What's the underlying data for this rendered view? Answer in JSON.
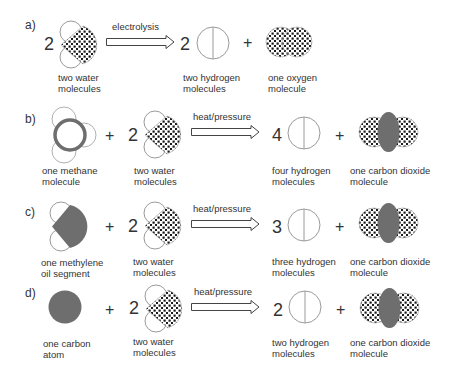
{
  "rows": [
    {
      "label": "a)",
      "reactants": [
        {
          "coef": "2",
          "molecule": "water",
          "caption": "two water\nmolecules"
        }
      ],
      "process": "electrolysis",
      "products": [
        {
          "coef": "2",
          "molecule": "hydrogen",
          "caption": "two hydrogen\nmolecules"
        },
        {
          "coef": "",
          "molecule": "oxygen",
          "caption": "one oxygen\nmolecule"
        }
      ]
    },
    {
      "label": "b)",
      "reactants": [
        {
          "coef": "",
          "molecule": "methane",
          "caption": "one methane\nmolecule"
        },
        {
          "coef": "2",
          "molecule": "water",
          "caption": "two water\nmolecules"
        }
      ],
      "process": "heat/pressure",
      "products": [
        {
          "coef": "4",
          "molecule": "hydrogen",
          "caption": "four hydrogen\nmolecules"
        },
        {
          "coef": "",
          "molecule": "carbon-dioxide",
          "caption": "one carbon dioxide\nmolecule"
        }
      ]
    },
    {
      "label": "c)",
      "reactants": [
        {
          "coef": "",
          "molecule": "methylene",
          "caption": "one methylene\noil segment"
        },
        {
          "coef": "2",
          "molecule": "water",
          "caption": "two water\nmolecules"
        }
      ],
      "process": "heat/pressure",
      "products": [
        {
          "coef": "3",
          "molecule": "hydrogen",
          "caption": "three hydrogen\nmolecules"
        },
        {
          "coef": "",
          "molecule": "carbon-dioxide",
          "caption": "one carbon dioxide\nmolecule"
        }
      ]
    },
    {
      "label": "d)",
      "reactants": [
        {
          "coef": "",
          "molecule": "carbon-atom",
          "caption": "one carbon\natom"
        },
        {
          "coef": "2",
          "molecule": "water",
          "caption": "two water\nmolecules"
        }
      ],
      "process": "heat/pressure",
      "products": [
        {
          "coef": "2",
          "molecule": "hydrogen",
          "caption": "two hydrogen\nmolecules"
        },
        {
          "coef": "",
          "molecule": "carbon-dioxide",
          "caption": "one carbon dioxide\nmolecule"
        }
      ]
    }
  ],
  "symbols": {
    "plus": "+"
  },
  "colors": {
    "outline": "#9a9a9a",
    "carbon": "#6e6e6e",
    "dots": "#1a1a1a",
    "text": "#333333"
  }
}
